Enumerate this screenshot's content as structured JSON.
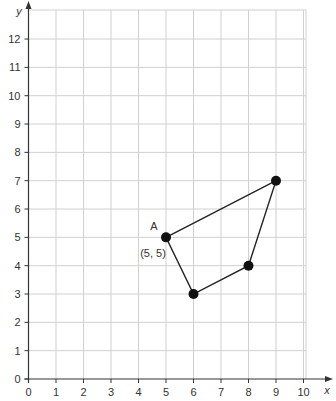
{
  "chart_data": {
    "type": "scatter",
    "title": "",
    "xlabel": "x",
    "ylabel": "y",
    "xlim": [
      0,
      10
    ],
    "ylim": [
      0,
      12
    ],
    "xticks": [
      0,
      1,
      2,
      3,
      4,
      5,
      6,
      7,
      8,
      9,
      10
    ],
    "yticks": [
      0,
      1,
      2,
      3,
      4,
      5,
      6,
      7,
      8,
      9,
      10,
      11,
      12
    ],
    "grid": true,
    "shape": "quadrilateral",
    "points": [
      {
        "x": 5,
        "y": 5,
        "label": "A",
        "coord_label": "(5, 5)"
      },
      {
        "x": 9,
        "y": 7,
        "label": ""
      },
      {
        "x": 8,
        "y": 4,
        "label": ""
      },
      {
        "x": 6,
        "y": 3,
        "label": ""
      }
    ],
    "polygon_order": [
      0,
      1,
      2,
      3
    ]
  },
  "layout": {
    "origin_px": [
      28.5,
      379
    ],
    "unit_x_px": 27.5,
    "unit_y_px": 28.33,
    "grid_right_px": 306,
    "grid_top_px": 10
  },
  "colors": {
    "grid": "#d0d0d0",
    "axis": "#333333",
    "point": "#111111",
    "line": "#222222"
  }
}
